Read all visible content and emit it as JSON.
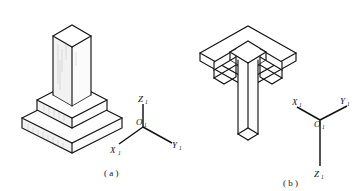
{
  "figure": {
    "background_color": "#ffffff",
    "line_color": "#141414",
    "width": 356,
    "height": 191
  },
  "panels": [
    {
      "id": "panel-a",
      "caption": "( a )",
      "caption_letter": "a",
      "description": "Stepped square pedestal with tall vertical prism, viewed from above",
      "view": "top-front-right isometric",
      "axes": {
        "origin_label": "O",
        "origin_subscript": "1",
        "vertical": {
          "label": "Z",
          "subscript": "1",
          "direction": "up"
        },
        "left": {
          "label": "X",
          "subscript": "1",
          "direction": "down-left"
        },
        "right": {
          "label": "Y",
          "subscript": "1",
          "direction": "down-right"
        }
      },
      "object": {
        "name": "stepped-pedestal-column",
        "tiers": 2,
        "column": "rectangular prism",
        "orientation": "column upward"
      }
    },
    {
      "id": "panel-b",
      "caption": "( b )",
      "caption_letter": "b",
      "description": "Same stepped pedestal column viewed from below, inverted",
      "view": "bottom-front isometric",
      "axes": {
        "origin_label": "O",
        "origin_subscript": "1",
        "vertical": {
          "label": "Z",
          "subscript": "1",
          "direction": "down"
        },
        "left": {
          "label": "X",
          "subscript": "1",
          "direction": "up-left"
        },
        "right": {
          "label": "Y",
          "subscript": "1",
          "direction": "up-right"
        }
      },
      "object": {
        "name": "stepped-pedestal-column-inverted",
        "tiers": 2,
        "column": "rectangular prism",
        "orientation": "column downward"
      }
    }
  ]
}
